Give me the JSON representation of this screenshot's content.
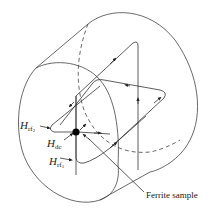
{
  "diagram": {
    "labels": {
      "h_rf2": {
        "main": "H",
        "sub": "rf",
        "subsub": "2"
      },
      "h_dc": {
        "main": "H",
        "sub": "dc"
      },
      "h_rf1": {
        "main": "H",
        "sub": "rf",
        "subsub": "1"
      },
      "ferrite_sample": "Ferrite sample"
    },
    "colors": {
      "line": "#333333",
      "sample": "#000000",
      "background": "#ffffff"
    }
  }
}
